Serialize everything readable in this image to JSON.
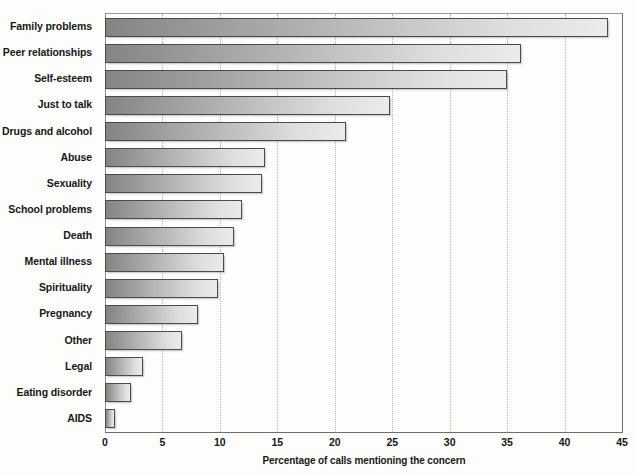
{
  "chart_data": {
    "type": "bar",
    "orientation": "horizontal",
    "title": "",
    "xlabel": "Percentage of calls mentioning the concern",
    "ylabel": "",
    "xlim": [
      0,
      45
    ],
    "xticks": [
      0,
      5,
      10,
      15,
      20,
      25,
      30,
      35,
      40,
      45
    ],
    "grid": "vertical dotted gridlines",
    "legend": "none",
    "categories": [
      "Family problems",
      "Peer relationships",
      "Self-esteem",
      "Just to talk",
      "Drugs and alcohol",
      "Abuse",
      "Sexuality",
      "School problems",
      "Death",
      "Mental illness",
      "Spirituality",
      "Pregnancy",
      "Other",
      "Legal",
      "Eating disorder",
      "AIDS"
    ],
    "values": [
      43.8,
      36.2,
      35.0,
      24.8,
      21.0,
      13.9,
      13.7,
      11.9,
      11.2,
      10.4,
      9.8,
      8.1,
      6.7,
      3.3,
      2.3,
      0.9
    ],
    "bar_fill_start_color": "#848484",
    "bar_fill_end_color": "#ebebeb",
    "bar_border_color": "#4b4b4b",
    "gridline_color": "#b4b4b4",
    "axis_color": "#6e6e6e",
    "background_color": "#fdfdfb"
  }
}
